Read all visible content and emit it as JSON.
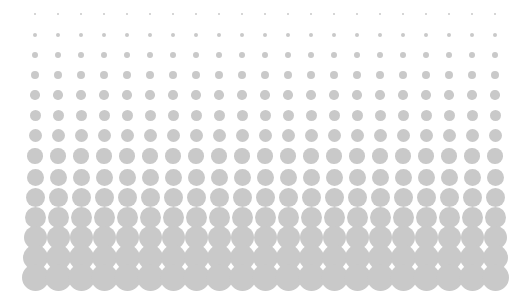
{
  "graphic": {
    "type": "halftone-dot-gradient",
    "background": "#ffffff",
    "dot_color": "#c9c9c9",
    "columns": 21,
    "rows": 14,
    "first_column_x": 35,
    "column_spacing": 23,
    "row_centers_y": [
      14,
      35,
      55,
      75,
      95,
      115,
      135,
      156,
      177,
      197,
      217,
      237,
      257,
      277
    ],
    "row_diameters": [
      2,
      4,
      6,
      8,
      9.5,
      11,
      13,
      15.5,
      17,
      19,
      21,
      23,
      25,
      27
    ]
  }
}
